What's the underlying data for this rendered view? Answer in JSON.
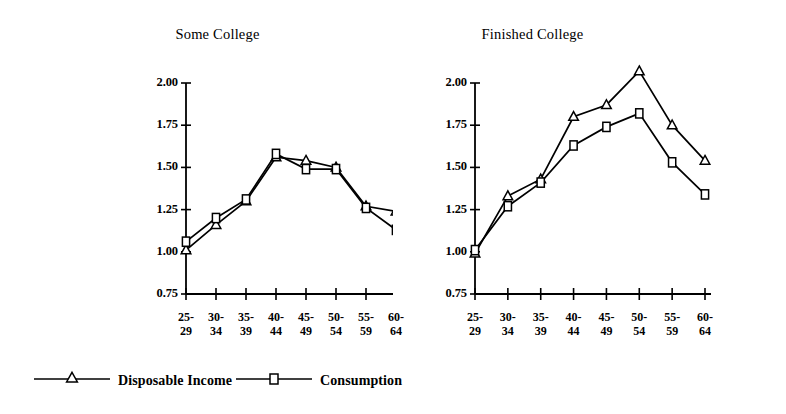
{
  "figure": {
    "background": "#ffffff",
    "ink_color": "#000000"
  },
  "legend": {
    "position": "bottom-left",
    "entries": [
      {
        "label": "Disposable Income",
        "marker": "open-triangle",
        "color": "#000000"
      },
      {
        "label": "Consumption",
        "marker": "open-square",
        "color": "#000000"
      }
    ]
  },
  "panels": [
    {
      "id": "left",
      "title": "Some College"
    },
    {
      "id": "right",
      "title": "Finished College"
    }
  ],
  "axis": {
    "y_ticks": [
      "2.00",
      "1.75",
      "1.50",
      "1.25",
      "1.00",
      "0.75"
    ],
    "x_ticks": [
      {
        "top": "25-",
        "bottom": "29"
      },
      {
        "top": "30-",
        "bottom": "34"
      },
      {
        "top": "35-",
        "bottom": "39"
      },
      {
        "top": "40-",
        "bottom": "44"
      },
      {
        "top": "45-",
        "bottom": "49"
      },
      {
        "top": "50-",
        "bottom": "54"
      },
      {
        "top": "55-",
        "bottom": "59"
      },
      {
        "top": "60-",
        "bottom": "64"
      }
    ]
  },
  "chart_data": [
    {
      "type": "line",
      "title": "Some College",
      "xlabel": "",
      "ylabel": "",
      "categories": [
        "25-29",
        "30-34",
        "35-39",
        "40-44",
        "45-49",
        "50-54",
        "55-59",
        "60-64"
      ],
      "ylim": [
        0.75,
        2.0
      ],
      "yticks": [
        0.75,
        1.0,
        1.25,
        1.5,
        1.75,
        2.0
      ],
      "grid": false,
      "legend_position": "bottom-left",
      "series": [
        {
          "name": "Disposable Income",
          "marker": "open-triangle",
          "color": "#000000",
          "values": [
            1.01,
            1.16,
            1.3,
            1.56,
            1.54,
            1.5,
            1.27,
            1.24
          ]
        },
        {
          "name": "Consumption",
          "marker": "open-square",
          "color": "#000000",
          "values": [
            1.06,
            1.2,
            1.31,
            1.58,
            1.49,
            1.49,
            1.26,
            1.13
          ]
        }
      ]
    },
    {
      "type": "line",
      "title": "Finished College",
      "xlabel": "",
      "ylabel": "",
      "categories": [
        "25-29",
        "30-34",
        "35-39",
        "40-44",
        "45-49",
        "50-54",
        "55-59",
        "60-64"
      ],
      "ylim": [
        0.75,
        2.0
      ],
      "yticks": [
        0.75,
        1.0,
        1.25,
        1.5,
        1.75,
        2.0
      ],
      "grid": false,
      "legend_position": "bottom-left",
      "series": [
        {
          "name": "Disposable Income",
          "marker": "open-triangle",
          "color": "#000000",
          "values": [
            0.99,
            1.33,
            1.43,
            1.8,
            1.87,
            2.07,
            1.75,
            1.54
          ]
        },
        {
          "name": "Consumption",
          "marker": "open-square",
          "color": "#000000",
          "values": [
            1.01,
            1.27,
            1.41,
            1.63,
            1.74,
            1.82,
            1.53,
            1.34
          ]
        }
      ]
    }
  ]
}
